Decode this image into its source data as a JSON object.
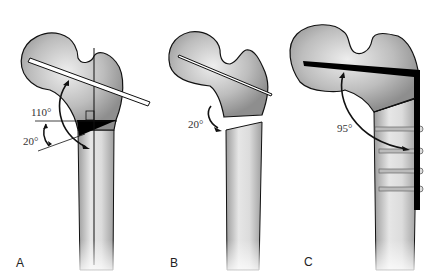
{
  "figure": {
    "panels": [
      {
        "id": "A",
        "label": "A",
        "angles": [
          {
            "id": "a110",
            "label": "110°"
          },
          {
            "id": "a20",
            "label": "20°"
          }
        ]
      },
      {
        "id": "B",
        "label": "B",
        "angles": [
          {
            "id": "b20",
            "label": "20°"
          }
        ]
      },
      {
        "id": "C",
        "label": "C",
        "angles": [
          {
            "id": "c95",
            "label": "95°"
          }
        ],
        "screws": 4
      }
    ],
    "colors": {
      "bone": "#c8c8c8",
      "bone_dark": "#9a9a9a",
      "outline": "#111111",
      "implant": "#000000",
      "background": "#ffffff"
    }
  }
}
